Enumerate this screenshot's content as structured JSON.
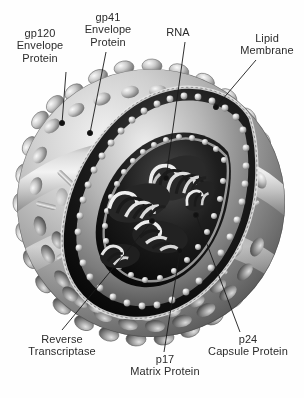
{
  "figure": {
    "background_color": "#ffffff",
    "text_color": "#2b2b2b",
    "line_color": "#1a1a1a",
    "style": "grayscale airbrush scientific illustration"
  },
  "labels": [
    {
      "id": "gp120",
      "line1": "gp120",
      "line2": "Envelope",
      "line3": "Protein"
    },
    {
      "id": "gp41",
      "line1": "gp41",
      "line2": "Envelope",
      "line3": "Protein"
    },
    {
      "id": "rna",
      "line1": "RNA",
      "line2": "",
      "line3": ""
    },
    {
      "id": "lipid",
      "line1": "Lipid",
      "line2": "Membrane",
      "line3": ""
    },
    {
      "id": "rt",
      "line1": "Reverse",
      "line2": "Transcriptase",
      "line3": ""
    },
    {
      "id": "p17",
      "line1": "p17",
      "line2": "Matrix Protein",
      "line3": ""
    },
    {
      "id": "p24",
      "line1": "p24",
      "line2": "Capsule Protein",
      "line3": ""
    }
  ],
  "leaders": {
    "gp120": {
      "from_x": 66,
      "from_y": 72,
      "to_x": 62,
      "to_y": 123
    },
    "gp41": {
      "from_x": 106,
      "from_y": 52,
      "to_x": 90,
      "to_y": 133
    },
    "rna": {
      "from_x": 185,
      "from_y": 42,
      "to_x": 166,
      "to_y": 178
    },
    "lipid": {
      "from_x": 256,
      "from_y": 60,
      "to_x": 216,
      "to_y": 107
    },
    "rt": {
      "from_x": 62,
      "from_y": 330,
      "to_x": 152,
      "to_y": 221
    },
    "p17": {
      "from_x": 164,
      "from_y": 352,
      "to_x": 180,
      "to_y": 251
    },
    "p24": {
      "from_x": 240,
      "from_y": 332,
      "to_x": 196,
      "to_y": 215
    }
  },
  "structure": {
    "virion_center_x": 151,
    "virion_center_y": 203,
    "virion_radius": 134,
    "envelope_label": "lipid bilayer envelope",
    "spike_count": 46,
    "capsid_label": "conical capsid core",
    "rna_coil_label": "coiled RNA genome strands"
  }
}
